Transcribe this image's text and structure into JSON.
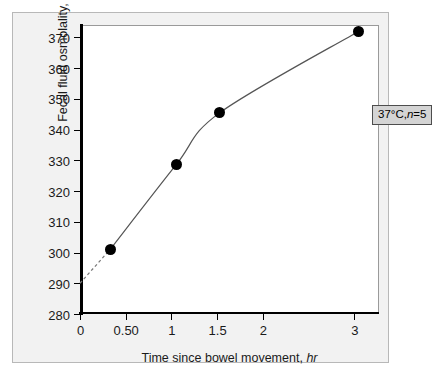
{
  "chart_data": {
    "type": "line",
    "title": "",
    "xlabel": "Time since bowel movement, hr",
    "xlabel_plain": "Time since bowel movement,",
    "xlabel_units": "hr",
    "ylabel": "Fecal fluid osmolality, mOsm/kg",
    "ylabel_plain": "Fecal fluid osmolality,",
    "ylabel_units": "mOsm/kg",
    "xlim": [
      0,
      3.27
    ],
    "ylim": [
      280,
      374
    ],
    "grid": false,
    "legend": "none",
    "xticks": [
      {
        "value": 0,
        "label": "0"
      },
      {
        "value": 0.5,
        "label": "0.50"
      },
      {
        "value": 1,
        "label": "1"
      },
      {
        "value": 1.5,
        "label": "1.5"
      },
      {
        "value": 2,
        "label": "2"
      },
      {
        "value": 3,
        "label": "3"
      }
    ],
    "yticks": [
      {
        "value": 280,
        "label": "280"
      },
      {
        "value": 290,
        "label": "290"
      },
      {
        "value": 300,
        "label": "300"
      },
      {
        "value": 310,
        "label": "310"
      },
      {
        "value": 320,
        "label": "320"
      },
      {
        "value": 330,
        "label": "330"
      },
      {
        "value": 340,
        "label": "340"
      },
      {
        "value": 350,
        "label": "350"
      },
      {
        "value": 360,
        "label": "360"
      },
      {
        "value": 370,
        "label": "370"
      }
    ],
    "series": [
      {
        "name": "Fecal fluid osmolality",
        "x": [
          0.33,
          1.05,
          1.53,
          3.05
        ],
        "values": [
          301,
          328.5,
          345.5,
          372
        ],
        "marker": "filled-circle",
        "marker_color": "#000000",
        "line_color": "#555555"
      }
    ],
    "extrapolation": {
      "style": "dashed",
      "x": [
        0,
        0.33
      ],
      "values": [
        290,
        301
      ],
      "color": "#777777"
    },
    "annotations": [
      {
        "text": "37°C,n=5",
        "text_plain": "37°C,",
        "text_italic": "n",
        "text_tail": "=5",
        "x": 2.0,
        "y": 351,
        "box_fill": "#d4d4d4",
        "box_border": "#4d4d4d"
      }
    ]
  },
  "figure": {
    "panel_background": "#f2f2f2",
    "panel_border": "#b8b8b8",
    "plot_background": "#ffffff",
    "axis_color": "#000000"
  }
}
